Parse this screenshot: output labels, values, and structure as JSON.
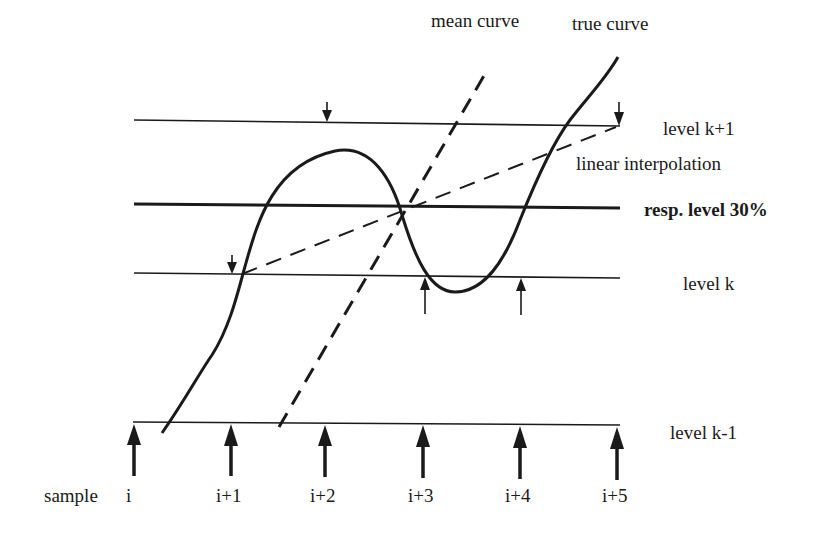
{
  "colors": {
    "background": "#ffffff",
    "ink": "#1a1a1a"
  },
  "labels": {
    "mean_curve": "mean curve",
    "true_curve": "true curve",
    "linear_interpolation": "linear interpolation",
    "level_k_plus_1": "level k+1",
    "response_level": "resp. level 30%",
    "level_k": "level k",
    "level_k_minus_1": "level k-1"
  },
  "samples": {
    "prefix": "sample",
    "ticks": [
      "i",
      "i+1",
      "i+2",
      "i+3",
      "i+4",
      "i+5"
    ]
  },
  "levels": [
    {
      "name": "level k+1",
      "style": "thin"
    },
    {
      "name": "resp. level 30%",
      "style": "bold"
    },
    {
      "name": "level k",
      "style": "thin"
    },
    {
      "name": "level k-1",
      "style": "thin"
    }
  ],
  "markers": {
    "down_arrows": [
      "crossing at level k+1 (near i+2)",
      "crossing at level k+1 (near i+5)",
      "crossing at level k (near i+1)"
    ],
    "up_arrows_level_k": [
      "crossing near i+3",
      "crossing near i+4"
    ],
    "sample_arrows_count": 6
  }
}
